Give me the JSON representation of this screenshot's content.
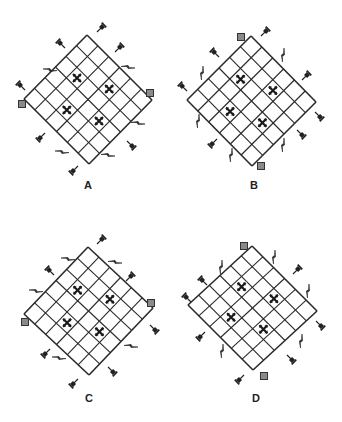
{
  "figure": {
    "grid_size": 6,
    "line_color": "#2a2a2a",
    "marker_color": "#1a1a1a",
    "square_fill": "#8a8a8a",
    "panels": [
      {
        "label": "A",
        "top": [
          87,
          35
        ],
        "right": [
          152,
          100
        ],
        "bottom": [
          88,
          167
        ],
        "left": [
          24,
          99
        ],
        "label_pos": [
          88,
          179
        ],
        "marks": [
          [
            1,
            2
          ],
          [
            3,
            1
          ],
          [
            2,
            4
          ],
          [
            4,
            3
          ]
        ],
        "squares": [
          [
            22,
            104
          ],
          [
            150,
            93
          ]
        ],
        "pins": [
          {
            "x": 97,
            "y": 32,
            "angle": -45
          },
          {
            "x": 65,
            "y": 48,
            "angle": -135
          },
          {
            "x": 115,
            "y": 52,
            "angle": -45
          },
          {
            "x": 25,
            "y": 90,
            "angle": -135
          },
          {
            "x": 45,
            "y": 133,
            "angle": 135
          },
          {
            "x": 127,
            "y": 141,
            "angle": 45
          },
          {
            "x": 78,
            "y": 166,
            "angle": 135
          }
        ],
        "bolts": [
          {
            "x": 50,
            "y": 70,
            "angle": 0
          },
          {
            "x": 128,
            "y": 67,
            "angle": 180
          },
          {
            "x": 138,
            "y": 123,
            "angle": 180
          },
          {
            "x": 62,
            "y": 152,
            "angle": 0
          },
          {
            "x": 108,
            "y": 155,
            "angle": 180
          }
        ]
      },
      {
        "label": "B",
        "top": [
          251,
          36
        ],
        "right": [
          316,
          102
        ],
        "bottom": [
          252,
          166
        ],
        "left": [
          187,
          100
        ],
        "label_pos": [
          254,
          179
        ],
        "marks": [
          [
            1,
            2
          ],
          [
            3,
            1
          ],
          [
            2,
            4
          ],
          [
            4,
            3
          ]
        ],
        "squares": [
          [
            241,
            37
          ],
          [
            261,
            166
          ]
        ],
        "pins": [
          {
            "x": 261,
            "y": 36,
            "angle": -45
          },
          {
            "x": 219,
            "y": 57,
            "angle": -135
          },
          {
            "x": 187,
            "y": 91,
            "angle": -135
          },
          {
            "x": 302,
            "y": 80,
            "angle": -45
          },
          {
            "x": 315,
            "y": 112,
            "angle": 45
          },
          {
            "x": 297,
            "y": 130,
            "angle": 45
          },
          {
            "x": 217,
            "y": 139,
            "angle": 135
          }
        ],
        "bolts": [
          {
            "x": 202,
            "y": 73,
            "angle": 90
          },
          {
            "x": 283,
            "y": 55,
            "angle": 90
          },
          {
            "x": 198,
            "y": 121,
            "angle": 90
          },
          {
            "x": 283,
            "y": 145,
            "angle": 90
          },
          {
            "x": 231,
            "y": 155,
            "angle": 90
          }
        ]
      },
      {
        "label": "C",
        "top": [
          88,
          247
        ],
        "right": [
          153,
          308
        ],
        "bottom": [
          87,
          379
        ],
        "left": [
          24,
          314
        ],
        "label_pos": [
          89,
          392
        ],
        "marks": [
          [
            1,
            2
          ],
          [
            3,
            1
          ],
          [
            2,
            4
          ],
          [
            4,
            3
          ]
        ],
        "squares": [
          [
            25,
            322
          ],
          [
            151,
            303
          ]
        ],
        "pins": [
          {
            "x": 97,
            "y": 244,
            "angle": -45
          },
          {
            "x": 54,
            "y": 275,
            "angle": -135
          },
          {
            "x": 126,
            "y": 281,
            "angle": -45
          },
          {
            "x": 150,
            "y": 325,
            "angle": 45
          },
          {
            "x": 50,
            "y": 349,
            "angle": 135
          },
          {
            "x": 108,
            "y": 367,
            "angle": 45
          },
          {
            "x": 78,
            "y": 379,
            "angle": 135
          }
        ],
        "bolts": [
          {
            "x": 68,
            "y": 259,
            "angle": 0
          },
          {
            "x": 115,
            "y": 262,
            "angle": 180
          },
          {
            "x": 36,
            "y": 291,
            "angle": 0
          },
          {
            "x": 131,
            "y": 346,
            "angle": 180
          },
          {
            "x": 59,
            "y": 358,
            "angle": 0
          }
        ]
      },
      {
        "label": "D",
        "top": [
          252,
          246
        ],
        "right": [
          317,
          311
        ],
        "bottom": [
          258,
          373
        ],
        "left": [
          188,
          305
        ],
        "label_pos": [
          256,
          392
        ],
        "marks": [
          [
            1,
            2
          ],
          [
            3,
            1
          ],
          [
            2,
            4
          ],
          [
            4,
            3
          ]
        ],
        "squares": [
          [
            244,
            246
          ],
          [
            264,
            376
          ]
        ],
        "pins": [
          {
            "x": 293,
            "y": 274,
            "angle": -45
          },
          {
            "x": 207,
            "y": 285,
            "angle": -135
          },
          {
            "x": 191,
            "y": 302,
            "angle": -135
          },
          {
            "x": 316,
            "y": 321,
            "angle": 45
          },
          {
            "x": 205,
            "y": 332,
            "angle": 135
          },
          {
            "x": 287,
            "y": 355,
            "angle": 45
          },
          {
            "x": 244,
            "y": 375,
            "angle": 135
          }
        ],
        "bolts": [
          {
            "x": 221,
            "y": 267,
            "angle": 90
          },
          {
            "x": 274,
            "y": 257,
            "angle": 90
          },
          {
            "x": 308,
            "y": 291,
            "angle": 90
          },
          {
            "x": 301,
            "y": 341,
            "angle": 90
          },
          {
            "x": 222,
            "y": 351,
            "angle": 90
          }
        ]
      }
    ]
  }
}
